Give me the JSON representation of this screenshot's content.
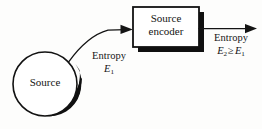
{
  "diagram": {
    "background_color": "#fdfdfc",
    "ink_color": "#111111",
    "nodes": {
      "source": {
        "shape": "circle",
        "label": "Source",
        "center_x": 45,
        "center_y": 84,
        "radius": 32,
        "has_drop_shadow": true
      },
      "encoder": {
        "shape": "rectangle",
        "label_line1": "Source",
        "label_line2": "encoder",
        "x": 133,
        "y": 7,
        "width": 66,
        "height": 40,
        "has_drop_shadow": true
      }
    },
    "edges": [
      {
        "id": "source-to-encoder",
        "style": "curved-arrow",
        "from": "source",
        "to": "encoder",
        "label_text": "Entropy",
        "label_symbol_base": "E",
        "label_symbol_sub": "1"
      },
      {
        "id": "encoder-output",
        "style": "straight-arrow",
        "from": "encoder",
        "to": "output",
        "label_text": "Entropy",
        "label_symbol_base_1": "E",
        "label_symbol_sub_1": "2",
        "label_relation": "≥",
        "label_symbol_base_2": "E",
        "label_symbol_sub_2": "1"
      }
    ]
  }
}
